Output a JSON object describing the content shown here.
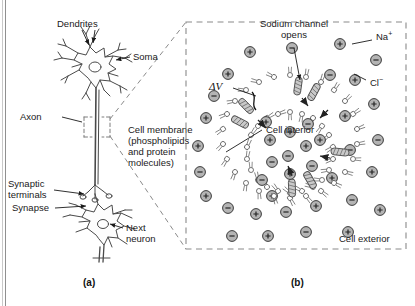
{
  "figure": {
    "type": "scientific-diagram",
    "panels": [
      {
        "id": "a",
        "label": "(a)",
        "caption": "Neuron with dendrites, soma, axon, synaptic terminals and next neuron"
      },
      {
        "id": "b",
        "label": "(b)",
        "caption": "Magnified cross-section of the axon cell membrane with an open sodium channel"
      }
    ]
  },
  "panel_a": {
    "label": "(a)",
    "labels": {
      "dendrites": "Dendrites",
      "soma": "Soma",
      "axon": "Axon",
      "synaptic_terminals": "Synaptic\nterminals",
      "synapse": "Synapse",
      "next_neuron": "Next\nneuron"
    }
  },
  "panel_b": {
    "label": "(b)",
    "labels": {
      "sodium_channel": "Sodium channel\nopens",
      "sodium_ion": "Na",
      "sodium_charge": "+",
      "chloride_ion": "Cl",
      "chloride_charge": "−",
      "delta_v": "ΔV",
      "cell_membrane": "Cell membrane\n(phospholipids\nand protein\nmolecules)",
      "cell_interior": "Cell interior",
      "cell_exterior": "Cell exterior"
    },
    "ion_symbols": {
      "positive": "+",
      "negative": "−"
    }
  },
  "colors": {
    "ink": "#1a1a1a",
    "ion_fill": "#b4b4b4",
    "ion_stroke": "#3a3a3a",
    "membrane_fill": "#ffffff",
    "membrane_stroke": "#5a5a5a",
    "protein_fill": "#c9c9c9",
    "dashed_border": "#8a8a8a",
    "neuron_stroke": "#4a4a4a"
  }
}
